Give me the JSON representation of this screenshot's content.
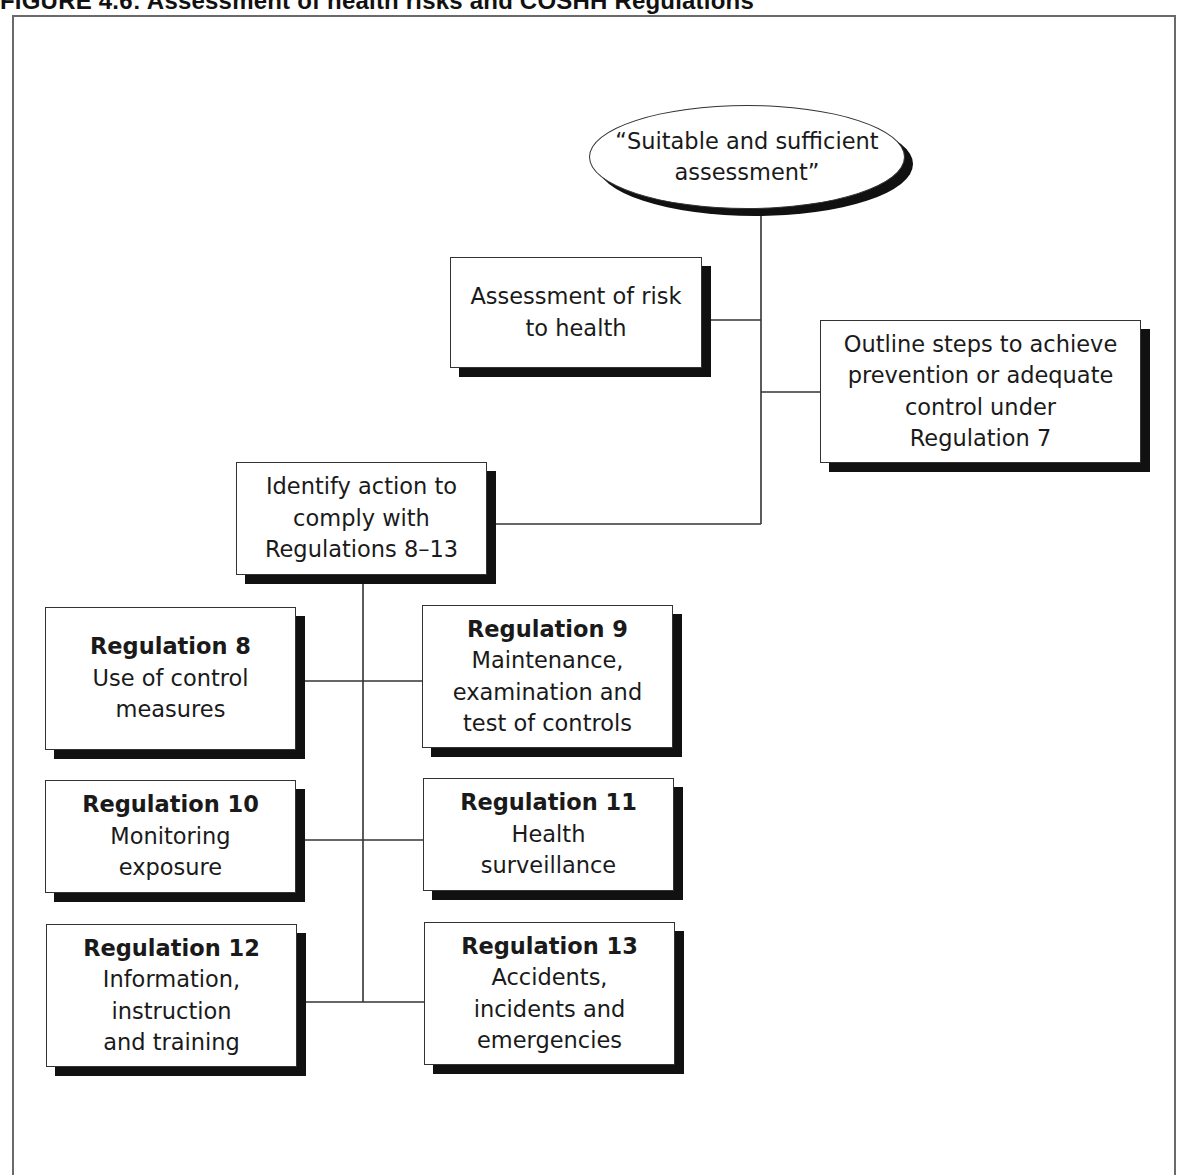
{
  "figure": {
    "caption": "FIGURE 4.6: Assessment of health risks and COSHH Regulations"
  },
  "diagram": {
    "root": {
      "lines": [
        "“Suitable and sufficient",
        "assessment”"
      ]
    },
    "risk_assessment": {
      "lines": [
        "Assessment of risk",
        "to health"
      ]
    },
    "regulation_7": {
      "lines": [
        "Outline steps to achieve",
        "prevention or adequate",
        "control under",
        "Regulation 7"
      ]
    },
    "identify_action": {
      "lines": [
        "Identify action to",
        "comply with",
        "Regulations 8–13"
      ]
    },
    "regulations": [
      {
        "title": "Regulation 8",
        "lines": [
          "Use of control",
          "measures"
        ]
      },
      {
        "title": "Regulation 9",
        "lines": [
          "Maintenance,",
          "examination and",
          "test of controls"
        ]
      },
      {
        "title": "Regulation 10",
        "lines": [
          "Monitoring",
          "exposure"
        ]
      },
      {
        "title": "Regulation 11",
        "lines": [
          "Health",
          "surveillance"
        ]
      },
      {
        "title": "Regulation 12",
        "lines": [
          "Information,",
          "instruction",
          "and training"
        ]
      },
      {
        "title": "Regulation 13",
        "lines": [
          "Accidents,",
          "incidents and",
          "emergencies"
        ]
      }
    ],
    "edges": [
      {
        "from": "root",
        "to": "risk_assessment"
      },
      {
        "from": "root",
        "to": "regulation_7"
      },
      {
        "from": "root",
        "to": "identify_action"
      },
      {
        "from": "identify_action",
        "to": "Regulation 8"
      },
      {
        "from": "identify_action",
        "to": "Regulation 9"
      },
      {
        "from": "identify_action",
        "to": "Regulation 10"
      },
      {
        "from": "identify_action",
        "to": "Regulation 11"
      },
      {
        "from": "identify_action",
        "to": "Regulation 12"
      },
      {
        "from": "identify_action",
        "to": "Regulation 13"
      }
    ]
  },
  "colors": {
    "stroke": "#333333",
    "shadow": "#111111",
    "frame": "#6a6a6a",
    "background": "#ffffff"
  }
}
